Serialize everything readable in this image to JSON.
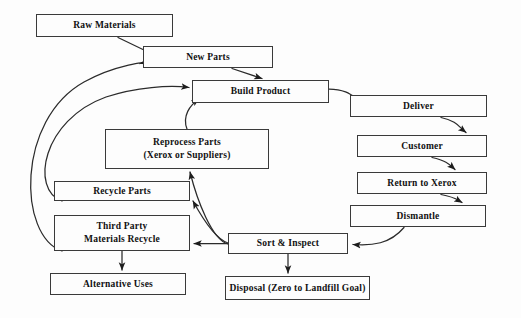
{
  "diagram": {
    "type": "flowchart",
    "background_color": "#fdfdfd",
    "stroke_color": "#3a3a3a",
    "text_color": "#111111",
    "nodes": [
      {
        "id": "raw-materials",
        "label": "Raw Materials",
        "lines": [
          "Raw Materials"
        ],
        "x": 36,
        "y": 14,
        "w": 137,
        "h": 23
      },
      {
        "id": "new-parts",
        "label": "New Parts",
        "lines": [
          "New Parts"
        ],
        "x": 143,
        "y": 46,
        "w": 130,
        "h": 22
      },
      {
        "id": "build-product",
        "label": "Build Product",
        "lines": [
          "Build Product"
        ],
        "x": 192,
        "y": 80,
        "w": 137,
        "h": 23
      },
      {
        "id": "deliver",
        "label": "Deliver",
        "lines": [
          "Deliver"
        ],
        "x": 350,
        "y": 95,
        "w": 137,
        "h": 22
      },
      {
        "id": "customer",
        "label": "Customer",
        "lines": [
          "Customer"
        ],
        "x": 357,
        "y": 135,
        "w": 130,
        "h": 22
      },
      {
        "id": "return-to-xerox",
        "label": "Return to Xerox",
        "lines": [
          "Return to Xerox"
        ],
        "x": 357,
        "y": 172,
        "w": 130,
        "h": 22
      },
      {
        "id": "dismantle",
        "label": "Dismantle",
        "lines": [
          "Dismantle"
        ],
        "x": 350,
        "y": 205,
        "w": 136,
        "h": 22
      },
      {
        "id": "reprocess-parts",
        "label": "Reprocess Parts (Xerox or Suppliers)",
        "lines": [
          "Reprocess Parts",
          "(Xerox or Suppliers)"
        ],
        "x": 105,
        "y": 129,
        "w": 164,
        "h": 40
      },
      {
        "id": "recycle-parts",
        "label": "Recycle Parts",
        "lines": [
          "Recycle Parts"
        ],
        "x": 54,
        "y": 181,
        "w": 136,
        "h": 20
      },
      {
        "id": "third-party-recycle",
        "label": "Third Party Materials Recycle",
        "lines": [
          "Third Party",
          "Materials Recycle"
        ],
        "x": 54,
        "y": 215,
        "w": 136,
        "h": 36
      },
      {
        "id": "alternative-uses",
        "label": "Alternative Uses",
        "lines": [
          "Alternative Uses"
        ],
        "x": 50,
        "y": 273,
        "w": 136,
        "h": 22
      },
      {
        "id": "sort-and-inspect",
        "label": "Sort & Inspect",
        "lines": [
          "Sort & Inspect"
        ],
        "x": 228,
        "y": 233,
        "w": 120,
        "h": 21
      },
      {
        "id": "disposal",
        "label": "Disposal (Zero to Landfill Goal)",
        "lines": [
          "Disposal (Zero to Landfill Goal)"
        ],
        "x": 225,
        "y": 276,
        "w": 145,
        "h": 24
      }
    ],
    "edges": [
      {
        "id": "raw-materials-to-new-parts",
        "from": "raw-materials",
        "to": "new-parts",
        "style": "straight"
      },
      {
        "id": "new-parts-to-build-product",
        "from": "new-parts",
        "to": "build-product",
        "style": "straight"
      },
      {
        "id": "build-product-to-deliver",
        "from": "build-product",
        "to": "deliver",
        "style": "curved"
      },
      {
        "id": "deliver-to-customer",
        "from": "deliver",
        "to": "customer",
        "style": "curved"
      },
      {
        "id": "customer-to-return-to-xerox",
        "from": "customer",
        "to": "return-to-xerox",
        "style": "curved"
      },
      {
        "id": "return-to-xerox-to-dismantle",
        "from": "return-to-xerox",
        "to": "dismantle",
        "style": "curved"
      },
      {
        "id": "dismantle-to-sort-and-inspect",
        "from": "dismantle",
        "to": "sort-and-inspect",
        "style": "curved"
      },
      {
        "id": "sort-and-inspect-to-reprocess-parts",
        "from": "sort-and-inspect",
        "to": "reprocess-parts",
        "style": "curved"
      },
      {
        "id": "sort-and-inspect-to-recycle-parts",
        "from": "sort-and-inspect",
        "to": "recycle-parts",
        "style": "curved"
      },
      {
        "id": "sort-and-inspect-to-third-party",
        "from": "sort-and-inspect",
        "to": "third-party-recycle",
        "style": "straight"
      },
      {
        "id": "sort-and-inspect-to-disposal",
        "from": "sort-and-inspect",
        "to": "disposal",
        "style": "straight"
      },
      {
        "id": "third-party-to-alternative-uses",
        "from": "third-party-recycle",
        "to": "alternative-uses",
        "style": "straight"
      },
      {
        "id": "reprocess-parts-to-build-product",
        "from": "reprocess-parts",
        "to": "build-product",
        "style": "curved"
      },
      {
        "id": "recycle-parts-to-build-product",
        "from": "recycle-parts",
        "to": "build-product",
        "style": "curved-long"
      },
      {
        "id": "third-party-to-new-parts",
        "from": "third-party-recycle",
        "to": "new-parts",
        "style": "curved-long"
      }
    ]
  }
}
